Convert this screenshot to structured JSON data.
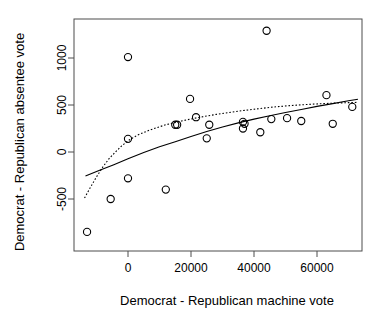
{
  "chart_data": {
    "type": "scatter",
    "title": "",
    "subtitle": "",
    "xlabel": "Democrat - Republican machine vote",
    "ylabel": "Democrat - Republican absentee vote",
    "xlim": [
      -18000,
      75000
    ],
    "ylim": [
      -1000,
      1450
    ],
    "xticks": [
      0,
      20000,
      40000,
      60000
    ],
    "xtick_labels": [
      "0",
      "20000",
      "40000",
      "60000"
    ],
    "yticks": [
      -500,
      0,
      500,
      1000
    ],
    "ytick_labels": [
      "-500",
      "0",
      "500",
      "1000"
    ],
    "grid": false,
    "legend": "none",
    "point_marker": "o",
    "points": [
      {
        "x": -13000,
        "y": -850
      },
      {
        "x": -5500,
        "y": -500
      },
      {
        "x": 0,
        "y": 1010
      },
      {
        "x": 0,
        "y": 140
      },
      {
        "x": 0,
        "y": -280
      },
      {
        "x": 12000,
        "y": -400
      },
      {
        "x": 15000,
        "y": 290
      },
      {
        "x": 15600,
        "y": 290
      },
      {
        "x": 19700,
        "y": 565
      },
      {
        "x": 21600,
        "y": 370
      },
      {
        "x": 25000,
        "y": 145
      },
      {
        "x": 25800,
        "y": 290
      },
      {
        "x": 36500,
        "y": 320
      },
      {
        "x": 36500,
        "y": 250
      },
      {
        "x": 37000,
        "y": 300
      },
      {
        "x": 42000,
        "y": 210
      },
      {
        "x": 44000,
        "y": 1290
      },
      {
        "x": 45500,
        "y": 350
      },
      {
        "x": 50500,
        "y": 360
      },
      {
        "x": 55000,
        "y": 330
      },
      {
        "x": 63000,
        "y": 605
      },
      {
        "x": 65000,
        "y": 300
      },
      {
        "x": 71200,
        "y": 480
      }
    ],
    "series": [
      {
        "name": "solid-fit-curve",
        "style": "solid",
        "x": [
          -13500,
          -9000,
          -4500,
          0,
          5000,
          10000,
          15000,
          20000,
          25000,
          30000,
          35000,
          40000,
          45000,
          50000,
          55000,
          60000,
          65000,
          70000,
          73000
        ],
        "y": [
          -255,
          -195,
          -135,
          -72,
          -5,
          55,
          110,
          165,
          218,
          265,
          310,
          350,
          385,
          420,
          452,
          485,
          515,
          545,
          562
        ]
      },
      {
        "name": "dotted-fit-curve",
        "style": "dotted",
        "x": [
          -13800,
          -12000,
          -10000,
          -8000,
          -6000,
          -4000,
          -2000,
          0,
          3000,
          7000,
          12000,
          17000,
          22000,
          28000,
          34000,
          40000,
          46000,
          52000,
          58000,
          64000,
          70000,
          73000
        ],
        "y": [
          -490,
          -380,
          -265,
          -160,
          -70,
          0,
          65,
          120,
          180,
          235,
          290,
          330,
          365,
          400,
          430,
          455,
          478,
          495,
          508,
          518,
          525,
          528
        ]
      }
    ]
  }
}
